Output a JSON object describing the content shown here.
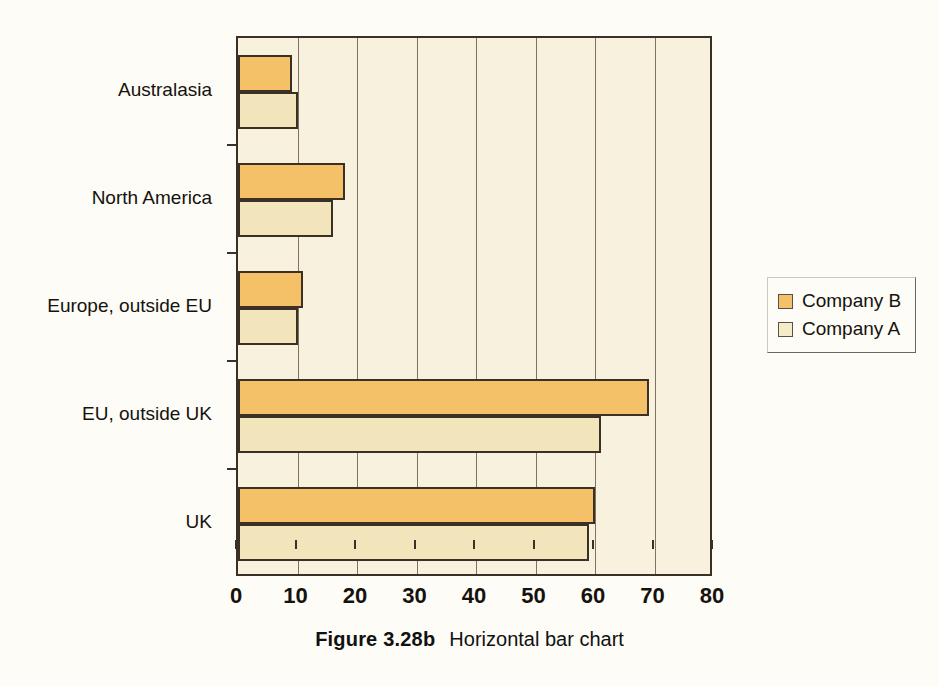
{
  "caption": {
    "figure_number": "Figure 3.28b",
    "title": "Horizontal bar chart"
  },
  "legend": {
    "position": "right",
    "entries": [
      {
        "label": "Company B",
        "color": "#f4c169"
      },
      {
        "label": "Company A",
        "color": "#f5ebc9"
      }
    ]
  },
  "colors": {
    "series_b": "#f4c169",
    "series_a": "#f2e5bc",
    "plot_background": "#f8f1dd",
    "page_background": "#fdfcf7",
    "outline": "#3a3026",
    "gridline": "#7d7362"
  },
  "axis": {
    "x_ticks": [
      "0",
      "10",
      "20",
      "30",
      "40",
      "50",
      "60",
      "70",
      "80"
    ],
    "x_min": 0,
    "x_max": 80,
    "y_categories": [
      "Australasia",
      "North America",
      "Europe, outside EU",
      "EU, outside UK",
      "UK"
    ]
  },
  "chart_data": {
    "type": "bar",
    "orientation": "horizontal",
    "title": "Horizontal bar chart",
    "xlabel": "",
    "ylabel": "",
    "xlim": [
      0,
      80
    ],
    "xticks": [
      0,
      10,
      20,
      30,
      40,
      50,
      60,
      70,
      80
    ],
    "grid": true,
    "legend_position": "right",
    "categories": [
      "Australasia",
      "North America",
      "Europe, outside EU",
      "EU, outside UK",
      "UK"
    ],
    "series": [
      {
        "name": "Company B",
        "color": "#f4c169",
        "values": [
          9,
          18,
          11,
          69,
          60
        ]
      },
      {
        "name": "Company A",
        "color": "#f2e5bc",
        "values": [
          10,
          16,
          10,
          61,
          59
        ]
      }
    ]
  }
}
